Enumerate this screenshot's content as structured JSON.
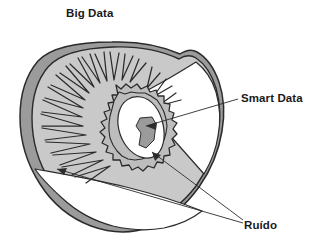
{
  "diagram": {
    "kind": "concentric-cross-section",
    "background_color": "#ffffff",
    "outline_color": "#2b2b2b",
    "labels": [
      {
        "id": "big-data",
        "text": "Big Data",
        "role": "outer-region-label",
        "has_leader_line": false
      },
      {
        "id": "smart-data",
        "text": "Smart Data",
        "role": "center-region-label",
        "has_leader_line": true,
        "arrow_count": 1
      },
      {
        "id": "ruido",
        "text": "Ruído",
        "role": "noise-region-label",
        "has_leader_line": true,
        "arrow_count": 2
      }
    ],
    "regions": [
      {
        "id": "outer-rind",
        "name": "outer rind ring",
        "fill": "#9b9b9b"
      },
      {
        "id": "flesh",
        "name": "flesh / big data area",
        "fill": "#c9c9c9"
      },
      {
        "id": "white-core",
        "name": "white core band",
        "fill": "#ffffff"
      },
      {
        "id": "seed-ring",
        "name": "jagged seed ring",
        "fill": "#bdbdbd"
      },
      {
        "id": "inner-center",
        "name": "inner center / smart data",
        "fill": "#ffffff"
      },
      {
        "id": "center-shadow",
        "name": "center shadow wedge",
        "fill": "#9b9b9b"
      }
    ],
    "colors": {
      "dark_gray": "#9b9b9b",
      "mid_gray": "#c9c9c9",
      "seed_ring_gray": "#bdbdbd",
      "white": "#ffffff",
      "stroke": "#2b2b2b",
      "text": "#1a1a1a"
    }
  }
}
